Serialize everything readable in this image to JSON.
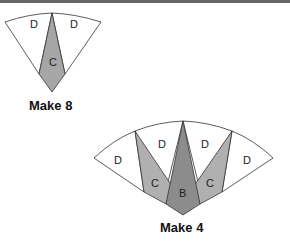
{
  "diagram_1": {
    "caption": "Make 8",
    "labels": {
      "d_left": "D",
      "d_right": "D",
      "c": "C"
    },
    "colors": {
      "c": "#a6a6a6",
      "d": "#ffffff",
      "stroke": "#333333"
    }
  },
  "diagram_2": {
    "caption": "Make 4",
    "labels": {
      "d1": "D",
      "d2": "D",
      "d3": "D",
      "d4": "D",
      "c_left": "C",
      "c_right": "C",
      "b": "B"
    },
    "colors": {
      "b": "#8c8c8c",
      "c": "#b0b0b0",
      "d": "#ffffff",
      "stroke": "#333333"
    }
  }
}
